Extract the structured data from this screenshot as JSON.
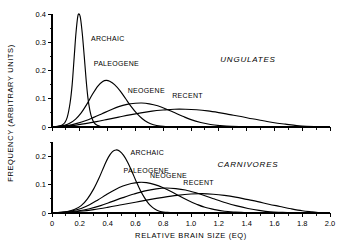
{
  "figure": {
    "ylabel": "FREQUENCY (ARBITRARY UNITS)",
    "xlabel": "RELATIVE BRAIN SIZE (EQ)"
  },
  "chart_data": [
    {
      "type": "line",
      "title": "UNGULATES",
      "panel": "top",
      "xlabel": "RELATIVE BRAIN SIZE (EQ)",
      "ylabel": "FREQUENCY (ARBITRARY UNITS)",
      "xlim": [
        0,
        2.0
      ],
      "ylim": [
        0,
        0.4
      ],
      "xticks": [
        0,
        0.2,
        0.4,
        0.6,
        0.8,
        1.0,
        1.2,
        1.4,
        1.6,
        1.8,
        2.0
      ],
      "xticklabels": [
        "0",
        "0.2",
        "0.4",
        "0.6",
        "0.8",
        "1.0",
        "1.2",
        "1.4",
        "1.6",
        "1.8",
        "2.0"
      ],
      "yticks": [
        0,
        0.1,
        0.2,
        0.3,
        0.4
      ],
      "yticklabels": [
        "0",
        "0.1",
        "0.2",
        "0.3",
        "0.4"
      ],
      "minor_x_step": 0.1,
      "minor_y_step": 0.05,
      "grid": false,
      "legend_position": "inline-labels",
      "series": [
        {
          "name": "ARCHAIC",
          "label_x": 0.28,
          "label_y": 0.305,
          "peak_x": 0.19,
          "peak_y": 0.4,
          "points": [
            [
              0.0,
              0.0
            ],
            [
              0.04,
              0.002
            ],
            [
              0.07,
              0.006
            ],
            [
              0.09,
              0.014
            ],
            [
              0.11,
              0.035
            ],
            [
              0.13,
              0.085
            ],
            [
              0.145,
              0.15
            ],
            [
              0.16,
              0.25
            ],
            [
              0.172,
              0.33
            ],
            [
              0.185,
              0.39
            ],
            [
              0.195,
              0.4
            ],
            [
              0.205,
              0.385
            ],
            [
              0.218,
              0.33
            ],
            [
              0.232,
              0.25
            ],
            [
              0.245,
              0.17
            ],
            [
              0.258,
              0.105
            ],
            [
              0.272,
              0.06
            ],
            [
              0.288,
              0.03
            ],
            [
              0.305,
              0.014
            ],
            [
              0.325,
              0.006
            ],
            [
              0.35,
              0.002
            ],
            [
              0.38,
              0.001
            ],
            [
              0.42,
              0.0
            ]
          ]
        },
        {
          "name": "PALEOGENE",
          "label_x": 0.3,
          "label_y": 0.215,
          "peak_x": 0.385,
          "peak_y": 0.165,
          "points": [
            [
              0.0,
              0.0
            ],
            [
              0.05,
              0.002
            ],
            [
              0.09,
              0.006
            ],
            [
              0.13,
              0.014
            ],
            [
              0.17,
              0.028
            ],
            [
              0.21,
              0.05
            ],
            [
              0.25,
              0.08
            ],
            [
              0.29,
              0.115
            ],
            [
              0.33,
              0.145
            ],
            [
              0.365,
              0.161
            ],
            [
              0.39,
              0.165
            ],
            [
              0.415,
              0.162
            ],
            [
              0.45,
              0.15
            ],
            [
              0.49,
              0.128
            ],
            [
              0.53,
              0.1
            ],
            [
              0.57,
              0.072
            ],
            [
              0.61,
              0.048
            ],
            [
              0.65,
              0.029
            ],
            [
              0.69,
              0.016
            ],
            [
              0.73,
              0.008
            ],
            [
              0.78,
              0.003
            ],
            [
              0.83,
              0.001
            ],
            [
              0.9,
              0.0
            ]
          ]
        },
        {
          "name": "NEOGENE",
          "label_x": 0.545,
          "label_y": 0.122,
          "peak_x": 0.625,
          "peak_y": 0.085,
          "points": [
            [
              0.0,
              0.0
            ],
            [
              0.06,
              0.002
            ],
            [
              0.12,
              0.006
            ],
            [
              0.18,
              0.013
            ],
            [
              0.24,
              0.022
            ],
            [
              0.3,
              0.034
            ],
            [
              0.36,
              0.047
            ],
            [
              0.42,
              0.06
            ],
            [
              0.48,
              0.072
            ],
            [
              0.54,
              0.08
            ],
            [
              0.6,
              0.084
            ],
            [
              0.645,
              0.085
            ],
            [
              0.7,
              0.082
            ],
            [
              0.76,
              0.075
            ],
            [
              0.82,
              0.064
            ],
            [
              0.88,
              0.051
            ],
            [
              0.94,
              0.038
            ],
            [
              1.0,
              0.026
            ],
            [
              1.07,
              0.016
            ],
            [
              1.14,
              0.009
            ],
            [
              1.21,
              0.005
            ],
            [
              1.29,
              0.002
            ],
            [
              1.38,
              0.001
            ],
            [
              1.48,
              0.0
            ]
          ]
        },
        {
          "name": "RECENT",
          "label_x": 0.865,
          "label_y": 0.102,
          "peak_x": 0.95,
          "peak_y": 0.063,
          "points": [
            [
              0.0,
              0.0
            ],
            [
              0.08,
              0.002
            ],
            [
              0.16,
              0.006
            ],
            [
              0.24,
              0.012
            ],
            [
              0.32,
              0.019
            ],
            [
              0.4,
              0.027
            ],
            [
              0.48,
              0.035
            ],
            [
              0.56,
              0.043
            ],
            [
              0.64,
              0.05
            ],
            [
              0.72,
              0.056
            ],
            [
              0.8,
              0.06
            ],
            [
              0.88,
              0.063
            ],
            [
              0.96,
              0.063
            ],
            [
              1.04,
              0.061
            ],
            [
              1.12,
              0.057
            ],
            [
              1.2,
              0.051
            ],
            [
              1.28,
              0.044
            ],
            [
              1.36,
              0.037
            ],
            [
              1.44,
              0.029
            ],
            [
              1.52,
              0.022
            ],
            [
              1.6,
              0.015
            ],
            [
              1.68,
              0.01
            ],
            [
              1.76,
              0.005
            ],
            [
              1.83,
              0.002
            ],
            [
              1.9,
              0.001
            ]
          ]
        }
      ]
    },
    {
      "type": "line",
      "title": "CARNIVORES",
      "panel": "bottom",
      "xlabel": "RELATIVE BRAIN SIZE (EQ)",
      "ylabel": "FREQUENCY (ARBITRARY UNITS)",
      "xlim": [
        0,
        2.0
      ],
      "ylim": [
        0,
        0.25
      ],
      "xticks": [
        0,
        0.2,
        0.4,
        0.6,
        0.8,
        1.0,
        1.2,
        1.4,
        1.6,
        1.8,
        2.0
      ],
      "xticklabels": [
        "0",
        "0.2",
        "0.4",
        "0.6",
        "0.8",
        "1.0",
        "1.2",
        "1.4",
        "1.6",
        "1.8",
        "2.0"
      ],
      "yticks": [
        0,
        0.1,
        0.2
      ],
      "yticklabels": [
        "0",
        "0.1",
        "0.2"
      ],
      "minor_x_step": 0.1,
      "minor_y_step": 0.05,
      "grid": false,
      "legend_position": "inline-labels",
      "series": [
        {
          "name": "ARCHAIC",
          "label_x": 0.565,
          "label_y": 0.205,
          "peak_x": 0.45,
          "peak_y": 0.222,
          "points": [
            [
              0.0,
              0.0
            ],
            [
              0.06,
              0.002
            ],
            [
              0.11,
              0.005
            ],
            [
              0.16,
              0.012
            ],
            [
              0.21,
              0.026
            ],
            [
              0.255,
              0.05
            ],
            [
              0.3,
              0.085
            ],
            [
              0.34,
              0.125
            ],
            [
              0.375,
              0.165
            ],
            [
              0.405,
              0.196
            ],
            [
              0.435,
              0.216
            ],
            [
              0.46,
              0.222
            ],
            [
              0.485,
              0.218
            ],
            [
              0.515,
              0.203
            ],
            [
              0.545,
              0.178
            ],
            [
              0.575,
              0.146
            ],
            [
              0.605,
              0.112
            ],
            [
              0.635,
              0.08
            ],
            [
              0.665,
              0.054
            ],
            [
              0.695,
              0.033
            ],
            [
              0.725,
              0.019
            ],
            [
              0.755,
              0.01
            ],
            [
              0.79,
              0.004
            ],
            [
              0.83,
              0.002
            ],
            [
              0.88,
              0.0
            ]
          ]
        },
        {
          "name": "PALEOGENE",
          "label_x": 0.515,
          "label_y": 0.142,
          "peak_x": 0.635,
          "peak_y": 0.108,
          "points": [
            [
              0.0,
              0.0
            ],
            [
              0.07,
              0.002
            ],
            [
              0.14,
              0.007
            ],
            [
              0.21,
              0.016
            ],
            [
              0.27,
              0.029
            ],
            [
              0.33,
              0.046
            ],
            [
              0.39,
              0.064
            ],
            [
              0.45,
              0.081
            ],
            [
              0.51,
              0.095
            ],
            [
              0.57,
              0.104
            ],
            [
              0.625,
              0.108
            ],
            [
              0.68,
              0.107
            ],
            [
              0.74,
              0.1
            ],
            [
              0.8,
              0.089
            ],
            [
              0.86,
              0.075
            ],
            [
              0.92,
              0.059
            ],
            [
              0.98,
              0.044
            ],
            [
              1.04,
              0.031
            ],
            [
              1.1,
              0.02
            ],
            [
              1.17,
              0.012
            ],
            [
              1.24,
              0.006
            ],
            [
              1.32,
              0.003
            ],
            [
              1.4,
              0.001
            ],
            [
              1.5,
              0.0
            ]
          ]
        },
        {
          "name": "NEOGENE",
          "label_x": 0.705,
          "label_y": 0.122,
          "peak_x": 0.805,
          "peak_y": 0.088,
          "points": [
            [
              0.0,
              0.0
            ],
            [
              0.09,
              0.002
            ],
            [
              0.18,
              0.007
            ],
            [
              0.27,
              0.015
            ],
            [
              0.35,
              0.026
            ],
            [
              0.43,
              0.04
            ],
            [
              0.51,
              0.054
            ],
            [
              0.59,
              0.067
            ],
            [
              0.67,
              0.078
            ],
            [
              0.75,
              0.085
            ],
            [
              0.82,
              0.088
            ],
            [
              0.89,
              0.086
            ],
            [
              0.96,
              0.081
            ],
            [
              1.03,
              0.072
            ],
            [
              1.1,
              0.061
            ],
            [
              1.17,
              0.049
            ],
            [
              1.25,
              0.036
            ],
            [
              1.33,
              0.025
            ],
            [
              1.41,
              0.016
            ],
            [
              1.49,
              0.009
            ],
            [
              1.57,
              0.004
            ],
            [
              1.66,
              0.002
            ],
            [
              1.75,
              0.0
            ]
          ]
        },
        {
          "name": "RECENT",
          "label_x": 0.945,
          "label_y": 0.098,
          "peak_x": 1.05,
          "peak_y": 0.068,
          "points": [
            [
              0.0,
              0.0
            ],
            [
              0.1,
              0.002
            ],
            [
              0.2,
              0.006
            ],
            [
              0.3,
              0.012
            ],
            [
              0.4,
              0.02
            ],
            [
              0.5,
              0.029
            ],
            [
              0.6,
              0.038
            ],
            [
              0.7,
              0.047
            ],
            [
              0.8,
              0.055
            ],
            [
              0.9,
              0.062
            ],
            [
              1.0,
              0.067
            ],
            [
              1.08,
              0.068
            ],
            [
              1.16,
              0.066
            ],
            [
              1.24,
              0.062
            ],
            [
              1.32,
              0.056
            ],
            [
              1.4,
              0.048
            ],
            [
              1.48,
              0.04
            ],
            [
              1.56,
              0.031
            ],
            [
              1.64,
              0.023
            ],
            [
              1.72,
              0.015
            ],
            [
              1.8,
              0.008
            ],
            [
              1.87,
              0.004
            ],
            [
              1.93,
              0.001
            ]
          ]
        }
      ]
    }
  ]
}
